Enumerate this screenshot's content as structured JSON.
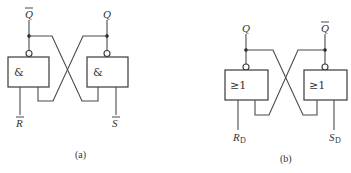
{
  "diagrams": [
    {
      "id": "a",
      "caption": "(a)",
      "gate_type": "NAND",
      "gates": [
        {
          "symbol": "&",
          "output_label": "Q",
          "output_overline": true,
          "input_label": "R",
          "input_overline": true
        },
        {
          "symbol": "&",
          "output_label": "Q",
          "output_overline": false,
          "input_label": "S",
          "input_overline": true
        }
      ]
    },
    {
      "id": "b",
      "caption": "(b)",
      "gate_type": "NOR",
      "gates": [
        {
          "symbol": "≥1",
          "output_label": "Q",
          "output_overline": false,
          "input_label": "R",
          "input_subscript": "D"
        },
        {
          "symbol": "≥1",
          "output_label": "Q",
          "output_overline": true,
          "input_label": "S",
          "input_subscript": "D"
        }
      ]
    }
  ],
  "colors": {
    "line": "#3a3a3a",
    "background": "#ffffff"
  }
}
